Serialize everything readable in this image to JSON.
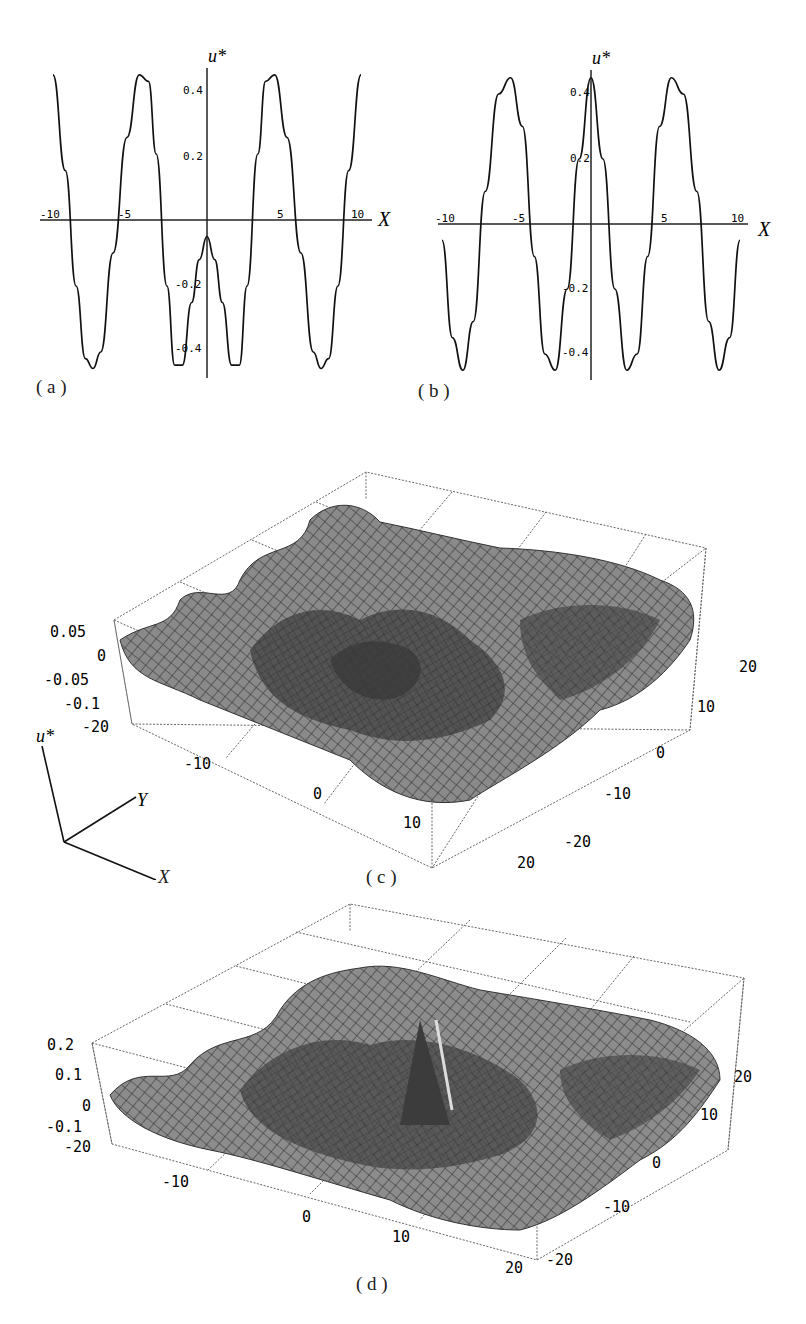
{
  "chart_data": [
    {
      "id": "a",
      "type": "line",
      "caption": "( a )",
      "xlabel": "X",
      "ylabel": "u*",
      "xlim": [
        -10,
        10
      ],
      "ylim": [
        -0.45,
        0.45
      ],
      "x_ticks": [
        "-10",
        "-5",
        "5",
        "10"
      ],
      "y_ticks": [
        "0.4",
        "0.2",
        "-0.2",
        "-0.4"
      ],
      "grid": false,
      "series": [
        {
          "name": "u*(X)",
          "x": [
            -10,
            -9.2,
            -8.5,
            -7.9,
            -7.4,
            -6.9,
            -6.1,
            -5.2,
            -4.4,
            -3.8,
            -3.3,
            -2.6,
            -2.1,
            -1.6,
            -1.0,
            -0.5,
            0,
            0.5,
            1.0,
            1.6,
            2.1,
            2.6,
            3.3,
            3.8,
            4.4,
            5.2,
            6.1,
            6.9,
            7.4,
            7.9,
            8.5,
            9.2,
            10
          ],
          "y": [
            0.44,
            0.15,
            -0.2,
            -0.42,
            -0.45,
            -0.4,
            -0.1,
            0.25,
            0.44,
            0.42,
            0.2,
            -0.2,
            -0.44,
            -0.44,
            -0.25,
            -0.12,
            -0.05,
            -0.12,
            -0.25,
            -0.44,
            -0.44,
            -0.2,
            0.2,
            0.42,
            0.44,
            0.25,
            -0.1,
            -0.4,
            -0.45,
            -0.42,
            -0.2,
            0.15,
            0.44
          ]
        }
      ]
    },
    {
      "id": "b",
      "type": "line",
      "caption": "( b )",
      "xlabel": "X",
      "ylabel": "u*",
      "xlim": [
        -10,
        10
      ],
      "ylim": [
        -0.45,
        0.45
      ],
      "x_ticks": [
        "-10",
        "-5",
        "5",
        "10"
      ],
      "y_ticks": [
        "0.4",
        "0.2",
        "-0.2",
        "-0.4"
      ],
      "grid": false,
      "series": [
        {
          "name": "u*(X)",
          "x": [
            -10,
            -9.3,
            -8.6,
            -7.9,
            -7.1,
            -6.2,
            -5.4,
            -4.6,
            -3.8,
            -3.1,
            -2.4,
            -1.6,
            -0.8,
            0,
            0.8,
            1.6,
            2.4,
            3.1,
            3.8,
            4.6,
            5.4,
            6.2,
            7.1,
            7.9,
            8.6,
            9.3,
            10
          ],
          "y": [
            -0.05,
            -0.35,
            -0.45,
            -0.3,
            0.1,
            0.4,
            0.45,
            0.3,
            -0.1,
            -0.4,
            -0.45,
            -0.2,
            0.2,
            0.45,
            0.2,
            -0.2,
            -0.45,
            -0.4,
            -0.1,
            0.3,
            0.45,
            0.4,
            0.1,
            -0.3,
            -0.45,
            -0.35,
            -0.05
          ]
        }
      ]
    },
    {
      "id": "c",
      "type": "surface",
      "caption": "( c )",
      "xlabel": "X",
      "ylabel": "Y",
      "zlabel": "u*",
      "xlim": [
        -20,
        20
      ],
      "ylim": [
        -20,
        20
      ],
      "zlim": [
        -0.1,
        0.05
      ],
      "x_ticks": [
        "-20",
        "-10",
        "0",
        "10",
        "20"
      ],
      "y_ticks": [
        "-20",
        "-10",
        "0",
        "10",
        "20"
      ],
      "z_ticks": [
        "0.05",
        "0",
        "-0.05",
        "-0.1"
      ],
      "grid": true,
      "description": "Concentric ring-shaped ripples radiating from the origin with a crater at the center"
    },
    {
      "id": "d",
      "type": "surface",
      "caption": "( d )",
      "xlabel": "X",
      "ylabel": "Y",
      "zlabel": "u*",
      "xlim": [
        -20,
        20
      ],
      "ylim": [
        -20,
        20
      ],
      "zlim": [
        -0.1,
        0.2
      ],
      "x_ticks": [
        "-20",
        "-10",
        "0",
        "10",
        "20"
      ],
      "y_ticks": [
        "-20",
        "-10",
        "0",
        "10",
        "20"
      ],
      "z_ticks": [
        "0.2",
        "0.1",
        "0",
        "-0.1"
      ],
      "grid": true,
      "description": "Concentric ring-shaped ripples with a sharp spike at the center"
    }
  ],
  "figure": {
    "captions": {
      "a": "( a )",
      "b": "( b )",
      "c": "( c )",
      "d": "( d )"
    },
    "axis_legend": {
      "z": "u*",
      "y": "Y",
      "x": "X"
    },
    "panel_a": {
      "ylabel": "u*",
      "xlabel": "X",
      "x_ticks": [
        "-10",
        "-5",
        "5",
        "10"
      ],
      "y_ticks": [
        "0.4",
        "0.2",
        "-0.2",
        "-0.4"
      ]
    },
    "panel_b": {
      "ylabel": "u*",
      "xlabel": "X",
      "x_ticks": [
        "-10",
        "-5",
        "5",
        "10"
      ],
      "y_ticks": [
        "0.4",
        "0.2",
        "-0.2",
        "-0.4"
      ]
    },
    "panel_c": {
      "z_ticks": [
        "0.05",
        "0",
        "-0.05",
        "-0.1"
      ],
      "y_corner": "-20",
      "x_ticks": [
        "-10",
        "0",
        "10",
        "20"
      ],
      "y_ticks": [
        "20",
        "10",
        "0",
        "-10",
        "-20"
      ]
    },
    "panel_d": {
      "z_ticks": [
        "0.2",
        "0.1",
        "0",
        "-0.1"
      ],
      "y_corner": "-20",
      "x_ticks": [
        "-10",
        "0",
        "10",
        "20"
      ],
      "y_ticks": [
        "20",
        "10",
        "0",
        "-10",
        "-20"
      ]
    }
  }
}
